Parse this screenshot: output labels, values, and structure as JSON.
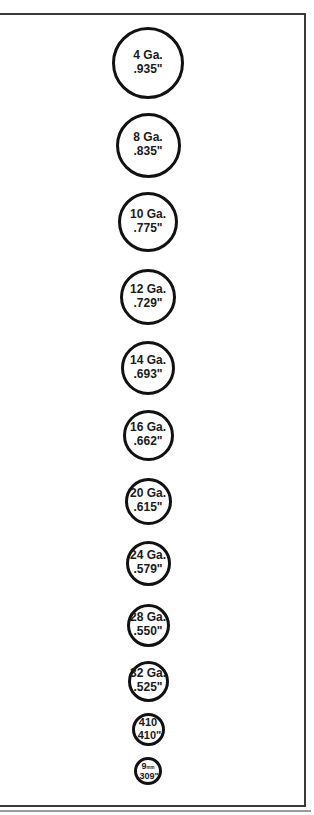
{
  "colors": {
    "stroke": "#111111",
    "text": "#1a1a1a",
    "frame": "#3a3a3a",
    "background": "#ffffff"
  },
  "gauges": [
    {
      "label": "4 Ga.",
      "diameter": ".935\"",
      "diameter_in": 0.935
    },
    {
      "label": "8 Ga.",
      "diameter": ".835\"",
      "diameter_in": 0.835
    },
    {
      "label": "10 Ga.",
      "diameter": ".775\"",
      "diameter_in": 0.775
    },
    {
      "label": "12 Ga.",
      "diameter": ".729\"",
      "diameter_in": 0.729
    },
    {
      "label": "14 Ga.",
      "diameter": ".693\"",
      "diameter_in": 0.693
    },
    {
      "label": "16 Ga.",
      "diameter": ".662\"",
      "diameter_in": 0.662
    },
    {
      "label": "20 Ga.",
      "diameter": ".615\"",
      "diameter_in": 0.615
    },
    {
      "label": "24 Ga.",
      "diameter": ".579\"",
      "diameter_in": 0.579
    },
    {
      "label": "28 Ga.",
      "diameter": ".550\"",
      "diameter_in": 0.55
    },
    {
      "label": "32 Ga.",
      "diameter": ".525\"",
      "diameter_in": 0.525
    },
    {
      "label": "410",
      "diameter": ".410\"",
      "diameter_in": 0.41
    },
    {
      "label": "9mm",
      "label_main": "9",
      "label_unit": "mm",
      "diameter": ".309\"",
      "diameter_in": 0.309
    }
  ]
}
